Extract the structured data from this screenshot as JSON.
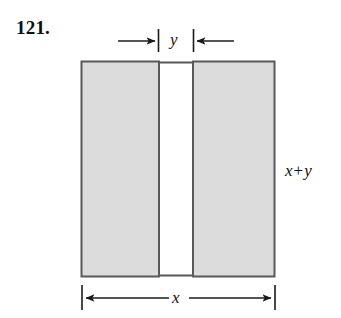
{
  "figure": {
    "problem_number": "121.",
    "type": "geometry-diagram",
    "labels": {
      "gap_width": "y",
      "total_width": "x",
      "height_var1": "x",
      "height_op": "+",
      "height_var2": "y",
      "height_full": "x + y"
    },
    "dimensions": {
      "rect_left": 81,
      "rect_right": 275,
      "rect_top": 61,
      "rect_bottom": 277,
      "gap_left": 159,
      "gap_right": 193,
      "total_width_px": 194,
      "total_height_px": 216,
      "gap_width_px": 34
    },
    "colors": {
      "shaded_fill": "#dcdcdc",
      "outline": "#595959",
      "background": "#ffffff",
      "text": "#111111",
      "dimension_line": "#1a1a1a"
    },
    "annotations": {
      "top_dimension": "inward-pointing arrows marking gap width y",
      "bottom_dimension": "double-headed arrow spanning full width x",
      "right_dimension": "height label x + y"
    }
  }
}
